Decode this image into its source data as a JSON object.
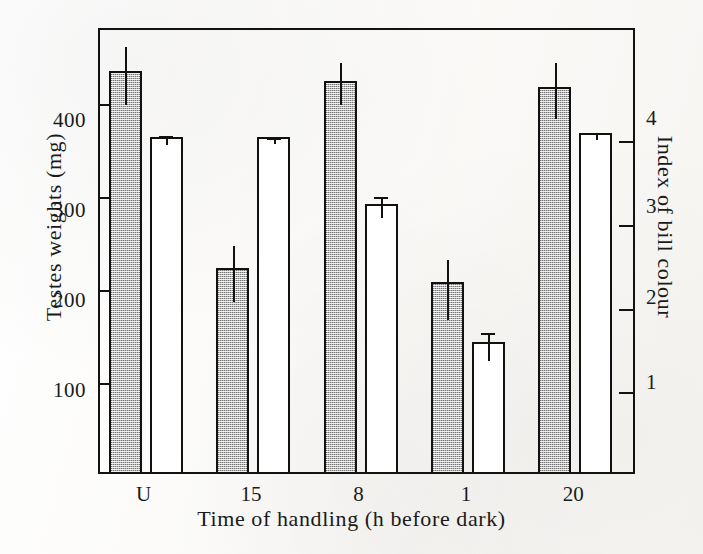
{
  "chart_data": {
    "type": "bar",
    "title": "",
    "subtitle": "",
    "xlabel": "Time of handling (h before dark)",
    "ylabel": "Testes weights (mg)",
    "ylabel_right": "Index of bill colour",
    "categories": [
      "U",
      "15",
      "8",
      "1",
      "20"
    ],
    "grid": false,
    "legend_position": "none",
    "ylim": [
      0,
      480
    ],
    "yticks": [
      100,
      200,
      300,
      400
    ],
    "ytick_labels": [
      "100",
      "200",
      "300",
      "400"
    ],
    "ylim_right": [
      0,
      5.33
    ],
    "yticks_right": [
      1,
      2,
      3,
      4
    ],
    "ytick_labels_right": [
      "1",
      "2",
      "3",
      "4"
    ],
    "series": [
      {
        "name": "Testes weights (mg)",
        "axis": "left",
        "style": "shaded",
        "values": [
          432,
          220,
          421,
          204,
          414
        ],
        "err_low": [
          33,
          33,
          22,
          36,
          30
        ],
        "err_high": [
          30,
          28,
          23,
          28,
          30
        ]
      },
      {
        "name": "Index of bill colour",
        "axis": "right",
        "style": "open",
        "values": [
          4.0,
          4.0,
          3.2,
          1.55,
          4.05
        ],
        "err_low": [
          0.05,
          0.03,
          0.12,
          0.18,
          0.04
        ],
        "err_high": [
          0.06,
          0.04,
          0.14,
          0.16,
          0.05
        ]
      }
    ],
    "annotations": []
  },
  "axes": {
    "left_title": "Testes weights (mg)",
    "right_title": "Index of bill colour",
    "x_title": "Time of handling (h before dark)"
  }
}
